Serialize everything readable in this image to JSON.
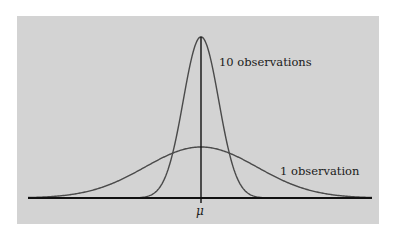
{
  "figure": {
    "background_color": "#d3d3d3",
    "curve_color": "#4a4a4a",
    "axis_color": "#111111",
    "mean_label": "μ",
    "labels": [
      {
        "id": "narrow",
        "text": "10 observations"
      },
      {
        "id": "wide",
        "text": "1 observation"
      }
    ]
  },
  "chart_data": {
    "type": "line",
    "title": "",
    "xlabel": "",
    "ylabel": "",
    "x_tick_labels": [
      "μ"
    ],
    "grid": false,
    "legend": "none (direct curve labels)",
    "series": [
      {
        "name": "1 observation",
        "distribution": "normal",
        "mean": 0,
        "sd": 1.0,
        "relative_peak_height": 1.0
      },
      {
        "name": "10 observations",
        "distribution": "normal",
        "mean": 0,
        "sd": 0.316,
        "relative_peak_height": 3.16
      }
    ],
    "annotations": [
      "vertical line at mean μ"
    ]
  }
}
